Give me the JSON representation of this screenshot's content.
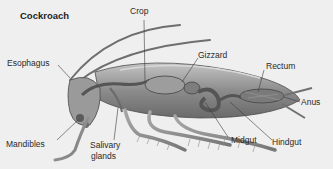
{
  "diagram": {
    "title": "Cockroach",
    "labels": {
      "crop": "Crop",
      "esophagus": "Esophagus",
      "gizzard": "Gizzard",
      "rectum": "Rectum",
      "anus": "Anus",
      "mandibles": "Mandibles",
      "salivary_glands_line1": "Salivary",
      "salivary_glands_line2": "glands",
      "midgut": "Midgut",
      "hindgut": "Hindgut"
    },
    "colors": {
      "background": "#efefef",
      "body": "#8f8f8f",
      "body_dark": "#5e5e5e",
      "body_light": "#b9b9b9",
      "line": "#3a3a3a",
      "text": "#2a2a2a"
    }
  }
}
